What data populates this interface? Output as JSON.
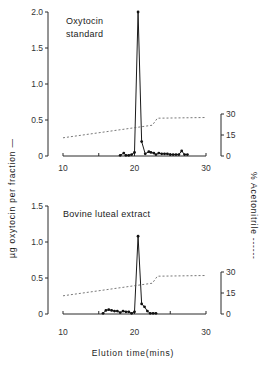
{
  "figure": {
    "ylabel_left": "µg oxytocin per fraction —",
    "ylabel_right": "% Acetonitrile ------",
    "xlabel": "Elution time(mins)"
  },
  "chart_data": [
    {
      "type": "line",
      "title": "Oxytocin standard",
      "title_lines": [
        "Oxytocin",
        "standard"
      ],
      "xlabel": "Elution time(mins)",
      "ylabel": "µg oxytocin per fraction",
      "y2label": "% Acetonitrile",
      "xlim": [
        10,
        30
      ],
      "ylim": [
        0,
        2.0
      ],
      "y2lim": [
        0,
        30
      ],
      "xticks": [
        10,
        15,
        20,
        25,
        30
      ],
      "xtick_labels": [
        "10",
        "20",
        "30"
      ],
      "yticks": [
        "0",
        "0.5",
        "1.0",
        "1.5",
        "2.0"
      ],
      "y2ticks": [
        "0",
        "15",
        "30"
      ],
      "grid": false,
      "series": [
        {
          "name": "µg oxytocin per fraction",
          "style": "solid with markers",
          "x": [
            18.0,
            18.5,
            18.8,
            19.2,
            19.6,
            20.0,
            20.5,
            21.0,
            21.5,
            22.0,
            22.3,
            22.7,
            23.0,
            23.4,
            23.8,
            24.2,
            24.6,
            25.0,
            25.4,
            25.8,
            26.2,
            26.6,
            27.0,
            27.4
          ],
          "y": [
            0.01,
            0.04,
            0.01,
            0.01,
            0.02,
            0.05,
            2.0,
            0.2,
            0.03,
            0.06,
            0.05,
            0.04,
            0.02,
            0.04,
            0.03,
            0.03,
            0.03,
            0.02,
            0.02,
            0.02,
            0.02,
            0.07,
            0.02,
            0.02
          ]
        },
        {
          "name": "% Acetonitrile",
          "style": "dashed",
          "axis": "right",
          "x": [
            10,
            22.5,
            23.2,
            30
          ],
          "y": [
            13,
            22,
            27,
            27.5
          ]
        }
      ]
    },
    {
      "type": "line",
      "title": "Bovine luteal extract",
      "title_lines": [
        "Bovine luteal extract"
      ],
      "xlabel": "Elution time(mins)",
      "ylabel": "µg oxytocin per fraction",
      "y2label": "% Acetonitrile",
      "xlim": [
        10,
        30
      ],
      "ylim": [
        0,
        1.5
      ],
      "y2lim": [
        0,
        30
      ],
      "xticks": [
        10,
        15,
        20,
        25,
        30
      ],
      "xtick_labels": [
        "10",
        "20",
        "30"
      ],
      "yticks": [
        "0",
        "0.5",
        "1.0",
        "1.5"
      ],
      "y2ticks": [
        "0",
        "15",
        "30"
      ],
      "grid": false,
      "series": [
        {
          "name": "µg oxytocin per fraction",
          "style": "solid with markers",
          "x": [
            15.6,
            16.0,
            16.4,
            16.8,
            17.2,
            17.6,
            18.0,
            18.4,
            18.8,
            19.2,
            19.6,
            20.0,
            20.5,
            21.0,
            21.4,
            21.8,
            22.2,
            22.6,
            23.0
          ],
          "y": [
            0.01,
            0.05,
            0.06,
            0.05,
            0.04,
            0.04,
            0.02,
            0.04,
            0.03,
            0.03,
            0.01,
            0.03,
            1.08,
            0.14,
            0.1,
            0.04,
            0.01,
            0.01,
            0.01
          ]
        },
        {
          "name": "% Acetonitrile",
          "style": "dashed",
          "axis": "right",
          "x": [
            10,
            22.5,
            23.2,
            30
          ],
          "y": [
            13,
            22,
            27,
            27.5
          ]
        }
      ]
    }
  ]
}
